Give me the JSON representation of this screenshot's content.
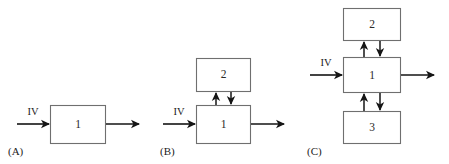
{
  "figure": {
    "width": 449,
    "height": 164,
    "background": "#ffffff",
    "line_color": "#151515",
    "box_stroke_color": "#6f6f6f",
    "box_fill_color": "#ffffff",
    "text_color": "#1c1c1c"
  },
  "panels": [
    {
      "id": "A",
      "label": "(A)",
      "input_label": "IV",
      "boxes": [
        {
          "name": "box-1",
          "label": "1"
        }
      ]
    },
    {
      "id": "B",
      "label": "(B)",
      "input_label": "IV",
      "boxes": [
        {
          "name": "box-2",
          "label": "2"
        },
        {
          "name": "box-1",
          "label": "1"
        }
      ]
    },
    {
      "id": "C",
      "label": "(C)",
      "input_label": "IV",
      "boxes": [
        {
          "name": "box-2",
          "label": "2"
        },
        {
          "name": "box-1",
          "label": "1"
        },
        {
          "name": "box-3",
          "label": "3"
        }
      ]
    }
  ]
}
